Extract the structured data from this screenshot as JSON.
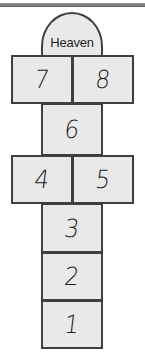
{
  "figure": {
    "background_color": "#ffffff",
    "cell_fill_color": "#e9e9e9",
    "cell_border_color": "#3f3f3f",
    "text_color": "#1d1d1d"
  },
  "top_rule": {
    "color": "#7d7d7d",
    "label": ""
  },
  "arch": {
    "label": "Heaven",
    "shape": "semicircle-dome"
  },
  "cells": [
    {
      "label": "8",
      "position": "top-right"
    },
    {
      "label": "7",
      "position": "top-left"
    },
    {
      "label": "6",
      "position": "middle-single"
    },
    {
      "label": "5",
      "position": "mid-right"
    },
    {
      "label": "4",
      "position": "mid-left"
    },
    {
      "label": "3",
      "position": "lower-single"
    },
    {
      "label": "2",
      "position": "lower-single"
    },
    {
      "label": "1",
      "position": "bottom-single"
    }
  ]
}
